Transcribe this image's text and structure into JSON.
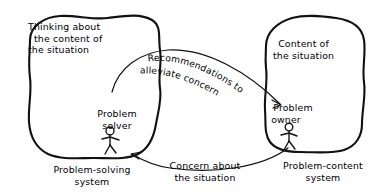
{
  "diagram": {
    "background_color": "#ffffff",
    "ink_color": "#111111",
    "left_blob": {
      "heading_line1": "Thinking about",
      "heading_line2": "the content of",
      "heading_line3": "the situation",
      "actor_label_line1": "Problem",
      "actor_label_line2": "solver",
      "actor_icon": "stick-figure-icon",
      "system_label_line1": "Problem-solving",
      "system_label_line2": "system"
    },
    "right_blob": {
      "heading_line1": "Content of",
      "heading_line2": "the situation",
      "actor_label_line1": "Problem",
      "actor_label_line2": "owner",
      "actor_icon": "stick-figure-icon",
      "system_label_line1": "Problem-content",
      "system_label_line2": "system"
    },
    "arrows": [
      {
        "id": "recommendations-arrow",
        "direction": "left-to-right",
        "label_line1": "Recommendations to",
        "label_line2": "alleviate concern"
      },
      {
        "id": "concern-arrow",
        "direction": "right-to-left",
        "label_line1": "Concern about",
        "label_line2": "the situation"
      }
    ]
  }
}
